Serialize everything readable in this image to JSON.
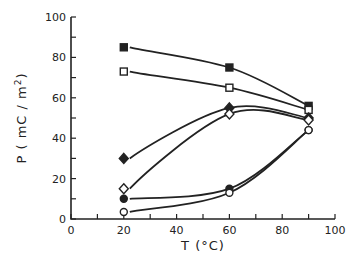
{
  "chart_data": {
    "type": "line",
    "title": "",
    "xlabel": "T (°C)",
    "ylabel": "P (mC/m²)",
    "ylabel_parts": {
      "main": "P ( mC / m",
      "sup": "2",
      "end": ")"
    },
    "xlim": [
      0,
      100
    ],
    "ylim": [
      0,
      100
    ],
    "xticks": [
      0,
      20,
      40,
      60,
      80,
      100
    ],
    "yticks": [
      0,
      20,
      40,
      60,
      80,
      100
    ],
    "grid": false,
    "legend": "none",
    "series": [
      {
        "name": "filled-square",
        "marker": "square-filled",
        "x": [
          20,
          60,
          90
        ],
        "y": [
          85,
          75,
          56
        ]
      },
      {
        "name": "open-square",
        "marker": "square-open",
        "x": [
          20,
          60,
          90
        ],
        "y": [
          73,
          65,
          54
        ]
      },
      {
        "name": "filled-diamond",
        "marker": "diamond-filled",
        "x": [
          20,
          60,
          90
        ],
        "y": [
          30,
          55,
          50
        ]
      },
      {
        "name": "open-diamond",
        "marker": "diamond-open",
        "x": [
          20,
          60,
          90
        ],
        "y": [
          15,
          52,
          49
        ]
      },
      {
        "name": "filled-circle",
        "marker": "circle-filled",
        "x": [
          20,
          60,
          90
        ],
        "y": [
          10,
          15,
          44
        ]
      },
      {
        "name": "open-circle",
        "marker": "circle-open",
        "x": [
          20,
          60,
          90
        ],
        "y": [
          3.5,
          13,
          44
        ]
      }
    ]
  }
}
